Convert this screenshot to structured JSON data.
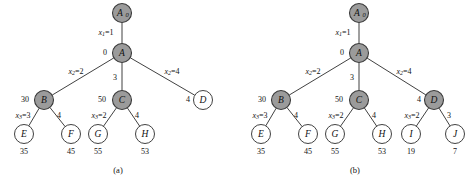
{
  "figure": {
    "type": "diagram",
    "colors": {
      "shaded_node_fill": "#9b9b9b",
      "open_node_fill": "#ffffff",
      "stroke": "#2b2b2b",
      "background": "#ffffff"
    },
    "panels": [
      {
        "caption": "(a)",
        "caption_x": 118,
        "caption_y": 171,
        "nodes": [
          {
            "id": "a-A0",
            "label": "A",
            "sub": "0",
            "x": 122,
            "y": 13,
            "r": 9.5,
            "style": "shaded"
          },
          {
            "id": "a-A",
            "label": "A",
            "sub": "",
            "x": 122,
            "y": 53,
            "r": 9.5,
            "style": "shaded"
          },
          {
            "id": "a-B",
            "label": "B",
            "sub": "",
            "x": 44,
            "y": 100,
            "r": 9.5,
            "style": "shaded"
          },
          {
            "id": "a-C",
            "label": "C",
            "sub": "",
            "x": 122,
            "y": 100,
            "r": 9.5,
            "style": "shaded"
          },
          {
            "id": "a-D",
            "label": "D",
            "sub": "",
            "x": 203,
            "y": 100,
            "r": 9.5,
            "style": "open"
          },
          {
            "id": "a-E",
            "label": "E",
            "sub": "",
            "x": 24,
            "y": 134,
            "r": 9.5,
            "style": "open"
          },
          {
            "id": "a-F",
            "label": "F",
            "sub": "",
            "x": 71,
            "y": 134,
            "r": 9.5,
            "style": "open"
          },
          {
            "id": "a-G",
            "label": "G",
            "sub": "",
            "x": 98,
            "y": 134,
            "r": 9.5,
            "style": "open"
          },
          {
            "id": "a-H",
            "label": "H",
            "sub": "",
            "x": 145,
            "y": 134,
            "r": 9.5,
            "style": "open"
          }
        ],
        "edges": [
          {
            "from": "a-A0",
            "to": "a-A"
          },
          {
            "from": "a-A",
            "to": "a-B"
          },
          {
            "from": "a-A",
            "to": "a-C"
          },
          {
            "from": "a-A",
            "to": "a-D"
          },
          {
            "from": "a-B",
            "to": "a-E"
          },
          {
            "from": "a-B",
            "to": "a-F"
          },
          {
            "from": "a-C",
            "to": "a-G"
          },
          {
            "from": "a-C",
            "to": "a-H"
          }
        ],
        "edge_labels": [
          {
            "name": "x1-eq-1",
            "var": "x",
            "varsub": "1",
            "value": "=1",
            "x": 106,
            "y": 33,
            "italic": true
          },
          {
            "name": "x2-eq-2",
            "var": "x",
            "varsub": "2",
            "value": "=2",
            "x": 76,
            "y": 72,
            "italic": true
          },
          {
            "name": "x2-eq-4",
            "var": "x",
            "varsub": "2",
            "value": "=4",
            "x": 172,
            "y": 72,
            "italic": true
          },
          {
            "name": "x3-eq-3",
            "var": "x",
            "varsub": "3",
            "value": "=3",
            "x": 23,
            "y": 116,
            "italic": true
          },
          {
            "name": "x3-eq-2",
            "var": "x",
            "varsub": "3",
            "value": "=2",
            "x": 99,
            "y": 116,
            "italic": true
          },
          {
            "name": "edge-c-3",
            "text": "3",
            "x": 115,
            "y": 78
          },
          {
            "name": "edge-bf-4",
            "text": "4",
            "x": 59,
            "y": 116
          },
          {
            "name": "edge-ch-4",
            "text": "4",
            "x": 137,
            "y": 116
          }
        ],
        "cost_labels": [
          {
            "name": "cost-A",
            "text": "0",
            "x": 105,
            "y": 53
          },
          {
            "name": "cost-B",
            "text": "30",
            "x": 25,
            "y": 100
          },
          {
            "name": "cost-C",
            "text": "50",
            "x": 102,
            "y": 100
          },
          {
            "name": "cost-D",
            "text": "4",
            "x": 188,
            "y": 100
          }
        ],
        "leaf_values": [
          {
            "name": "value-E",
            "text": "35",
            "x": 24,
            "y": 152
          },
          {
            "name": "value-F",
            "text": "45",
            "x": 71,
            "y": 152
          },
          {
            "name": "value-G",
            "text": "55",
            "x": 98,
            "y": 152
          },
          {
            "name": "value-H",
            "text": "53",
            "x": 145,
            "y": 152
          }
        ]
      },
      {
        "caption": "(b)",
        "caption_x": 355,
        "caption_y": 171,
        "nodes": [
          {
            "id": "b-A0",
            "label": "A",
            "sub": "0",
            "x": 359,
            "y": 13,
            "r": 9.5,
            "style": "shaded"
          },
          {
            "id": "b-A",
            "label": "A",
            "sub": "",
            "x": 359,
            "y": 53,
            "r": 9.5,
            "style": "shaded"
          },
          {
            "id": "b-B",
            "label": "B",
            "sub": "",
            "x": 281,
            "y": 100,
            "r": 9.5,
            "style": "shaded"
          },
          {
            "id": "b-C",
            "label": "C",
            "sub": "",
            "x": 359,
            "y": 100,
            "r": 9.5,
            "style": "shaded"
          },
          {
            "id": "b-D",
            "label": "D",
            "sub": "",
            "x": 434,
            "y": 100,
            "r": 9.5,
            "style": "shaded"
          },
          {
            "id": "b-E",
            "label": "E",
            "sub": "",
            "x": 261,
            "y": 134,
            "r": 9.5,
            "style": "open"
          },
          {
            "id": "b-F",
            "label": "F",
            "sub": "",
            "x": 308,
            "y": 134,
            "r": 9.5,
            "style": "open"
          },
          {
            "id": "b-G",
            "label": "G",
            "sub": "",
            "x": 335,
            "y": 134,
            "r": 9.5,
            "style": "open"
          },
          {
            "id": "b-H",
            "label": "H",
            "sub": "",
            "x": 382,
            "y": 134,
            "r": 9.5,
            "style": "open"
          },
          {
            "id": "b-I",
            "label": "I",
            "sub": "",
            "x": 411,
            "y": 134,
            "r": 9.5,
            "style": "open"
          },
          {
            "id": "b-J",
            "label": "J",
            "sub": "",
            "x": 455,
            "y": 134,
            "r": 9.5,
            "style": "open"
          }
        ],
        "edges": [
          {
            "from": "b-A0",
            "to": "b-A"
          },
          {
            "from": "b-A",
            "to": "b-B"
          },
          {
            "from": "b-A",
            "to": "b-C"
          },
          {
            "from": "b-A",
            "to": "b-D"
          },
          {
            "from": "b-B",
            "to": "b-E"
          },
          {
            "from": "b-B",
            "to": "b-F"
          },
          {
            "from": "b-C",
            "to": "b-G"
          },
          {
            "from": "b-C",
            "to": "b-H"
          },
          {
            "from": "b-D",
            "to": "b-I"
          },
          {
            "from": "b-D",
            "to": "b-J"
          }
        ],
        "edge_labels": [
          {
            "name": "x1-eq-1",
            "var": "x",
            "varsub": "1",
            "value": "=1",
            "x": 343,
            "y": 33,
            "italic": true
          },
          {
            "name": "x2-eq-2",
            "var": "x",
            "varsub": "2",
            "value": "=2",
            "x": 313,
            "y": 72,
            "italic": true
          },
          {
            "name": "x2-eq-4",
            "var": "x",
            "varsub": "2",
            "value": "=4",
            "x": 404,
            "y": 72,
            "italic": true
          },
          {
            "name": "x3-eq-3",
            "var": "x",
            "varsub": "3",
            "value": "=3",
            "x": 260,
            "y": 116,
            "italic": true
          },
          {
            "name": "x3-eq-2",
            "var": "x",
            "varsub": "3",
            "value": "=2",
            "x": 336,
            "y": 116,
            "italic": true
          },
          {
            "name": "x3-eq-2b",
            "var": "x",
            "varsub": "3",
            "value": "=2",
            "x": 412,
            "y": 116,
            "italic": true
          },
          {
            "name": "edge-c-3",
            "text": "3",
            "x": 352,
            "y": 78
          },
          {
            "name": "edge-bf-4",
            "text": "4",
            "x": 296,
            "y": 116
          },
          {
            "name": "edge-ch-4",
            "text": "4",
            "x": 374,
            "y": 116
          },
          {
            "name": "edge-dj-3",
            "text": "3",
            "x": 449,
            "y": 116
          }
        ],
        "cost_labels": [
          {
            "name": "cost-A",
            "text": "0",
            "x": 342,
            "y": 53
          },
          {
            "name": "cost-B",
            "text": "30",
            "x": 262,
            "y": 100
          },
          {
            "name": "cost-C",
            "text": "50",
            "x": 339,
            "y": 100
          },
          {
            "name": "cost-D",
            "text": "4",
            "x": 419,
            "y": 100
          }
        ],
        "leaf_values": [
          {
            "name": "value-E",
            "text": "35",
            "x": 261,
            "y": 152
          },
          {
            "name": "value-F",
            "text": "45",
            "x": 308,
            "y": 152
          },
          {
            "name": "value-G",
            "text": "55",
            "x": 335,
            "y": 152
          },
          {
            "name": "value-H",
            "text": "53",
            "x": 382,
            "y": 152
          },
          {
            "name": "value-I",
            "text": "19",
            "x": 411,
            "y": 152
          },
          {
            "name": "value-J",
            "text": "7",
            "x": 455,
            "y": 152
          }
        ]
      }
    ]
  }
}
